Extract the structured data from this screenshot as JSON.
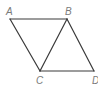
{
  "diagram": {
    "type": "geometry-figure",
    "points": [
      {
        "id": "A",
        "label": "A",
        "x": 10,
        "y": 19,
        "lx": 6,
        "ly": 15
      },
      {
        "id": "B",
        "label": "B",
        "x": 67,
        "y": 19,
        "lx": 65,
        "ly": 15
      },
      {
        "id": "C",
        "label": "C",
        "x": 40,
        "y": 71,
        "lx": 36,
        "ly": 84
      },
      {
        "id": "D",
        "label": "D",
        "x": 94,
        "y": 71,
        "lx": 92,
        "ly": 84
      }
    ],
    "segments": [
      {
        "from": "A",
        "to": "B"
      },
      {
        "from": "A",
        "to": "C"
      },
      {
        "from": "B",
        "to": "C"
      },
      {
        "from": "B",
        "to": "D"
      },
      {
        "from": "C",
        "to": "D"
      }
    ],
    "colors": {
      "line": "#3a3a3a",
      "label": "#7a7a7a",
      "background": "#ffffff"
    }
  }
}
